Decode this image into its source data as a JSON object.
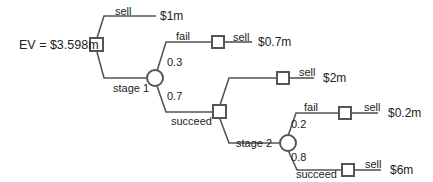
{
  "diagram": {
    "type": "decision-tree",
    "expected_value_label": "EV = $3.598m",
    "colors": {
      "line": "#555555",
      "node_fill": "#ffffff",
      "text": "#222222"
    },
    "root": {
      "type": "decision",
      "branches": [
        {
          "label": "sell",
          "outcome": "$1m"
        },
        {
          "label": "stage 1",
          "node": "chance-1"
        }
      ]
    },
    "chance_1": {
      "type": "chance",
      "branches": [
        {
          "label": "fail",
          "probability": "0.3",
          "next_label": "sell",
          "outcome": "$0.7m"
        },
        {
          "label": "succeed",
          "probability": "0.7",
          "node": "decision-2"
        }
      ]
    },
    "decision_2": {
      "type": "decision",
      "branches": [
        {
          "label": "sell",
          "outcome": "$2m"
        },
        {
          "label": "stage 2",
          "node": "chance-2"
        }
      ]
    },
    "chance_2": {
      "type": "chance",
      "branches": [
        {
          "label": "fail",
          "probability": "0.2",
          "next_label": "sell",
          "outcome": "$0.2m"
        },
        {
          "label": "succeed",
          "probability": "0.8",
          "next_label": "sell",
          "outcome": "$6m"
        }
      ]
    }
  }
}
